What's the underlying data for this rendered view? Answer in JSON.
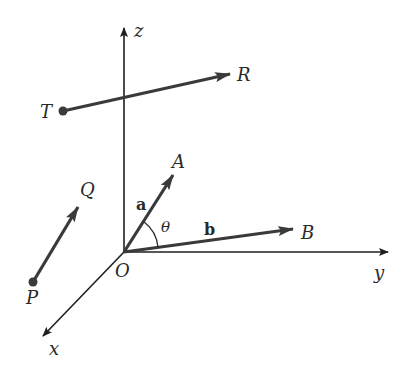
{
  "diagram": {
    "type": "3D coordinate axes with vectors",
    "colors": {
      "ink": "#2a2a2a",
      "axis": "#1f1f1f",
      "background": "#ffffff"
    },
    "axes": {
      "origin": {
        "label": "O",
        "x": 124,
        "y": 252
      },
      "x": {
        "label": "x",
        "from": [
          124,
          252
        ],
        "to": [
          42,
          337
        ]
      },
      "y": {
        "label": "y",
        "from": [
          124,
          252
        ],
        "to": [
          388,
          252
        ]
      },
      "z": {
        "label": "z",
        "from": [
          124,
          252
        ],
        "to": [
          124,
          27
        ]
      }
    },
    "vectors": [
      {
        "id": "TR",
        "tail_label": "T",
        "head_label": "R",
        "from": [
          63,
          111
        ],
        "to": [
          230,
          74
        ],
        "tail_dot": true
      },
      {
        "id": "PQ",
        "tail_label": "P",
        "head_label": "Q",
        "from": [
          33,
          282
        ],
        "to": [
          78,
          207
        ],
        "tail_dot": true
      },
      {
        "id": "a",
        "name": "a",
        "head_label": "A",
        "from": [
          124,
          252
        ],
        "to": [
          173,
          175
        ],
        "tail_dot": false
      },
      {
        "id": "b",
        "name": "b",
        "head_label": "B",
        "from": [
          124,
          252
        ],
        "to": [
          293,
          229
        ],
        "tail_dot": false
      }
    ],
    "angle": {
      "label": "θ",
      "between": [
        "a",
        "b"
      ]
    },
    "labels": {
      "z": "z",
      "y": "y",
      "x": "x",
      "O": "O",
      "T": "T",
      "R": "R",
      "P": "P",
      "Q": "Q",
      "A": "A",
      "B": "B",
      "a": "a",
      "b": "b",
      "theta": "θ"
    }
  }
}
